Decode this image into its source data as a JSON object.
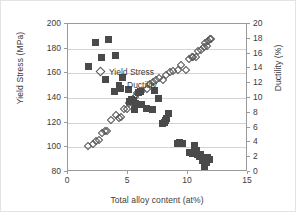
{
  "chart_data": {
    "type": "scatter",
    "title": "",
    "xlabel": "Total alloy content (at%)",
    "ylabel": "Yield Stress (MPa)",
    "y2label": "Ductility (%)",
    "xlim": [
      0,
      15
    ],
    "ylim": [
      80,
      200
    ],
    "y2lim": [
      0,
      20
    ],
    "xticks": [
      0,
      5,
      10,
      15
    ],
    "yticks": [
      80,
      100,
      120,
      140,
      160,
      180,
      200
    ],
    "y2ticks": [
      0,
      2,
      4,
      6,
      8,
      10,
      12,
      14,
      16,
      18,
      20
    ],
    "grid": "horizontal",
    "legend_position": "center-right-inside",
    "colors": {
      "yield_stress_marker": "#555555",
      "ductility_marker": "#4a4a4a",
      "gridline": "#d4d4d4",
      "axis": "#9a9a9a",
      "text": "#3b3b3b",
      "background": "#ffffff",
      "border": "#e3e3e3"
    },
    "series": [
      {
        "name": "Yield Stress",
        "axis": "left",
        "marker": "open-diamond",
        "units": "MPa",
        "points": [
          [
            1.7,
            101
          ],
          [
            2.05,
            103
          ],
          [
            2.35,
            105
          ],
          [
            2.55,
            106
          ],
          [
            2.85,
            112
          ],
          [
            3.05,
            113
          ],
          [
            3.25,
            113
          ],
          [
            3.55,
            122
          ],
          [
            4.0,
            126
          ],
          [
            4.25,
            124
          ],
          [
            4.4,
            125
          ],
          [
            4.7,
            131
          ],
          [
            4.9,
            131
          ],
          [
            5.1,
            136
          ],
          [
            5.25,
            137
          ],
          [
            5.4,
            139
          ],
          [
            5.55,
            141
          ],
          [
            5.75,
            144
          ],
          [
            5.95,
            145
          ],
          [
            6.2,
            146
          ],
          [
            6.55,
            147
          ],
          [
            6.85,
            151
          ],
          [
            7.1,
            153
          ],
          [
            7.35,
            155
          ],
          [
            7.6,
            156
          ],
          [
            7.95,
            155
          ],
          [
            8.15,
            159
          ],
          [
            8.5,
            161
          ],
          [
            8.75,
            162
          ],
          [
            9.2,
            163
          ],
          [
            9.45,
            167
          ],
          [
            9.8,
            163
          ],
          [
            10.05,
            172
          ],
          [
            10.3,
            173
          ],
          [
            10.45,
            173
          ],
          [
            10.7,
            173
          ],
          [
            10.85,
            178
          ],
          [
            11.05,
            179
          ],
          [
            11.3,
            181
          ],
          [
            11.45,
            185
          ],
          [
            11.55,
            182
          ],
          [
            11.7,
            186
          ],
          [
            11.85,
            188
          ],
          [
            11.95,
            188
          ]
        ]
      },
      {
        "name": "Ductility",
        "axis": "right",
        "marker": "filled-square",
        "units": "%",
        "points": [
          [
            1.7,
            14.2
          ],
          [
            2.25,
            17.5
          ],
          [
            2.8,
            15.5
          ],
          [
            3.1,
            12.5
          ],
          [
            3.35,
            17.9
          ],
          [
            3.85,
            10.9
          ],
          [
            3.95,
            15.7
          ],
          [
            4.35,
            11.3
          ],
          [
            4.55,
            12.8
          ],
          [
            5.0,
            11.2
          ],
          [
            5.15,
            9.5
          ],
          [
            5.3,
            9.8
          ],
          [
            5.45,
            9.6
          ],
          [
            5.5,
            8.4
          ],
          [
            5.6,
            9.3
          ],
          [
            5.85,
            10.7
          ],
          [
            6.0,
            10.9
          ],
          [
            6.15,
            9.1
          ],
          [
            6.55,
            8.6
          ],
          [
            7.05,
            8.4
          ],
          [
            7.2,
            11.0
          ],
          [
            7.55,
            9.9
          ],
          [
            7.85,
            6.6
          ],
          [
            8.0,
            6.7
          ],
          [
            8.1,
            6.9
          ],
          [
            8.2,
            7.2
          ],
          [
            8.35,
            7.9
          ],
          [
            9.1,
            3.9
          ],
          [
            9.3,
            4.0
          ],
          [
            9.55,
            3.8
          ],
          [
            10.15,
            2.6
          ],
          [
            10.35,
            2.5
          ],
          [
            10.55,
            3.6
          ],
          [
            10.7,
            2.9
          ],
          [
            10.8,
            2.3
          ],
          [
            10.95,
            2.1
          ],
          [
            11.05,
            2.4
          ],
          [
            11.2,
            1.6
          ],
          [
            11.35,
            0.8
          ],
          [
            11.5,
            1.3
          ],
          [
            11.65,
            1.9
          ],
          [
            11.8,
            1.7
          ]
        ]
      }
    ]
  }
}
